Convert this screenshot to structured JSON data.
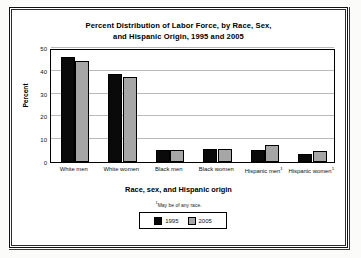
{
  "chart_data": {
    "type": "bar",
    "title": "Percent Distribution of Labor Force, by Race, Sex, and Hispanic Origin, 1995 and 2005",
    "title_line1": "Percent Distribution of Labor Force, by Race, Sex,",
    "title_line2": "and Hispanic Origin, 1995 and 2005",
    "xlabel": "Race, sex, and Hispanic origin",
    "ylabel": "Percent",
    "ylim": [
      0,
      50
    ],
    "yticks": [
      0,
      10,
      20,
      30,
      40,
      50
    ],
    "grid": true,
    "legend_position": "bottom",
    "categories": [
      "White men",
      "White women",
      "Black men",
      "Black women",
      "Hispanic men",
      "Hispanic women"
    ],
    "category_footnote_marker": [
      "",
      "",
      "",
      "",
      "1",
      "1"
    ],
    "series": [
      {
        "name": "1995",
        "color": "#0a0a0a",
        "values": [
          46.2,
          38.4,
          5.2,
          5.6,
          5.3,
          3.3
        ]
      },
      {
        "name": "2005",
        "color": "#a6a6a6",
        "values": [
          44.5,
          37.4,
          5.2,
          5.7,
          7.6,
          5.0
        ]
      }
    ],
    "footnote": "May be of any race.",
    "footnote_marker": "1"
  },
  "legend": {
    "items": [
      {
        "label": "1995",
        "swatch": "black"
      },
      {
        "label": "2005",
        "swatch": "gray"
      }
    ]
  },
  "axis": {
    "y_labels": [
      "50",
      "40",
      "30",
      "20",
      "10",
      "0"
    ],
    "y_title": "Percent",
    "x_title": "Race, sex, and Hispanic origin"
  }
}
